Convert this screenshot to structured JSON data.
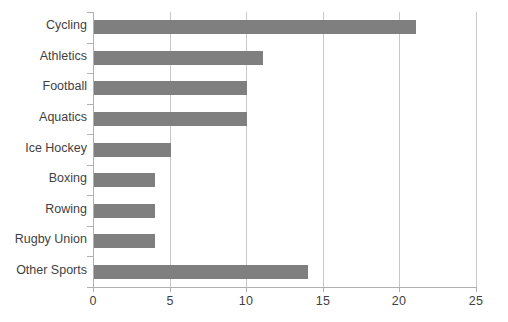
{
  "chart_data": {
    "type": "bar",
    "orientation": "horizontal",
    "title": "",
    "subtitle": "",
    "xlabel": "",
    "ylabel": "",
    "categories": [
      "Cycling",
      "Athletics",
      "Football",
      "Aquatics",
      "Ice Hockey",
      "Boxing",
      "Rowing",
      "Rugby Union",
      "Other Sports"
    ],
    "values": [
      21,
      11,
      10,
      10,
      5,
      4,
      4,
      4,
      14
    ],
    "xlim": [
      0,
      25
    ],
    "xticks": [
      0,
      5,
      10,
      15,
      20,
      25
    ],
    "xtick_labels": [
      "0",
      "5",
      "10",
      "15",
      "20",
      "25"
    ],
    "grid": "vertical",
    "legend": "none",
    "bar_color": "#7f7f7f",
    "axis_color": "#b0b0b0",
    "grid_color": "#c8c8c8",
    "background": "#ffffff"
  }
}
